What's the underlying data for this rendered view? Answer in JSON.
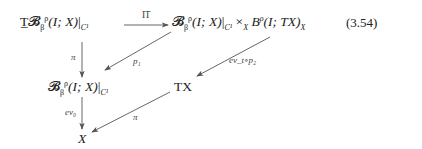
{
  "equation_number": "(3.54)",
  "nodes": {
    "top_left": "T̲𝓑ᵨ(I; X)|C¹",
    "top_left_parts": {
      "prefix": "T̲𝓑",
      "sup": "ρ",
      "sub": "β",
      "body": "(I; X)",
      "restrict": "C¹"
    },
    "top_right_parts": {
      "prefix": "𝓑",
      "sup": "ρ",
      "sub": "β",
      "body": "(I; X)",
      "restrict": "C¹",
      "times": "×",
      "times_sub": "X",
      "second": "B",
      "second_sup": "ρ",
      "second_body": "(I; TX)",
      "second_sub": "X"
    },
    "middle_left_parts": {
      "prefix": "𝓑",
      "sup": "ρ",
      "sub": "β",
      "body": "(I; X)",
      "restrict": "C¹"
    },
    "middle_right": "TX",
    "bottom": "X"
  },
  "arrows": {
    "top_horizontal": "Π̄",
    "left_vertical_top": "π",
    "diag_p1": "p₁",
    "diag_ev": "ev_t∘p₂",
    "left_vertical_bottom": "ev₀",
    "diag_pi": "π"
  },
  "colors": {
    "text": "#222222",
    "arrow": "#555555",
    "background": "#ffffff"
  }
}
